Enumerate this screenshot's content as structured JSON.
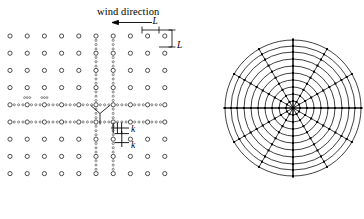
{
  "figure": {
    "title": "",
    "panels": [
      "cartesian-wind-farm-grid",
      "polar-mesh"
    ]
  },
  "annotations": {
    "wind_direction_label": "wind direction",
    "wind_arrow": "arrow-left",
    "spacing_label_horizontal": "L",
    "spacing_label_vertical": "L",
    "refined_label_horizontal": "k",
    "refined_label_vertical": "k"
  },
  "colors": {
    "ink": "#000000",
    "background": "#ffffff",
    "coarse_node": "#3a3a3a",
    "fine_node": "#555555"
  },
  "left_panel": {
    "name": "wind-farm-grid",
    "description": "regular grid of turbine positions with locally refined mesh bands",
    "grid": {
      "columns": 10,
      "rows": 9,
      "x_start": 10,
      "y_start": 36,
      "dx": 17.2,
      "dy": 17.2,
      "node_radius": 2.1
    },
    "refined_columns": [
      5,
      6
    ],
    "refined_rows": [
      4,
      5
    ],
    "refinement_subdivisions": 4,
    "connector": {
      "type": "y-branch",
      "x": 100,
      "y": 113
    },
    "wind_arrow": {
      "x_from": 152,
      "x_to": 112,
      "y": 22
    },
    "dimension_markers": [
      {
        "id": "L-horizontal",
        "x_from": 142,
        "x_to": 159,
        "y": 30
      },
      {
        "id": "L-vertical",
        "y_from": 30,
        "y_to": 47,
        "x": 172
      }
    ],
    "refined_markers": [
      {
        "id": "k-horizontal",
        "x_from": 113,
        "x_to": 122,
        "y": 128
      },
      {
        "id": "k-vertical",
        "y_from": 131,
        "y_to": 140,
        "x": 122
      }
    ]
  },
  "right_panel": {
    "name": "polar-mesh",
    "description": "radial / circumferential mesh used for the wake model",
    "center": {
      "x": 293,
      "y": 108
    },
    "rings": 10,
    "outer_radius": 68,
    "spokes": 12,
    "ring_radii": [
      7,
      14,
      21,
      28,
      35,
      42,
      49,
      56,
      62,
      68
    ],
    "node_size": 2.0,
    "axis_lines": [
      "horizontal",
      "vertical"
    ]
  }
}
